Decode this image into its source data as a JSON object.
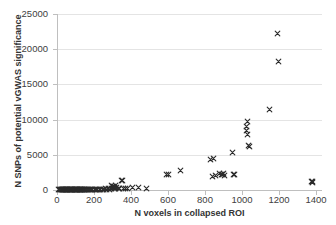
{
  "chart_data": {
    "type": "scatter",
    "title": "",
    "xlabel": "N voxels in collapsed ROI",
    "ylabel": "N SNPs of potential vGWAS significance",
    "xlim": [
      0,
      1400
    ],
    "ylim": [
      0,
      25000
    ],
    "grid": "horizontal",
    "legend": "none",
    "marker": "x",
    "marker_color": "#2b2b2b",
    "gridline_color": "#e4e4e4",
    "axis_color": "#bfbfbf",
    "xticks": [
      0,
      200,
      400,
      600,
      800,
      1000,
      1200,
      1400
    ],
    "xtick_labels": [
      "0",
      "200",
      "400",
      "600",
      "800",
      "1000",
      "1200",
      "1400"
    ],
    "yticks": [
      0,
      5000,
      10000,
      15000,
      20000,
      25000
    ],
    "ytick_labels": [
      "0",
      "5000",
      "10000",
      "15000",
      "20000",
      "25000"
    ],
    "series": [
      {
        "name": "ROIs",
        "points": [
          [
            10,
            40
          ],
          [
            15,
            35
          ],
          [
            18,
            50
          ],
          [
            22,
            30
          ],
          [
            25,
            60
          ],
          [
            28,
            45
          ],
          [
            30,
            55
          ],
          [
            33,
            40
          ],
          [
            36,
            70
          ],
          [
            38,
            35
          ],
          [
            41,
            50
          ],
          [
            44,
            60
          ],
          [
            47,
            45
          ],
          [
            50,
            80
          ],
          [
            53,
            40
          ],
          [
            56,
            65
          ],
          [
            59,
            55
          ],
          [
            62,
            70
          ],
          [
            65,
            45
          ],
          [
            68,
            60
          ],
          [
            71,
            50
          ],
          [
            74,
            75
          ],
          [
            77,
            55
          ],
          [
            80,
            65
          ],
          [
            83,
            45
          ],
          [
            86,
            70
          ],
          [
            89,
            60
          ],
          [
            92,
            80
          ],
          [
            95,
            50
          ],
          [
            98,
            65
          ],
          [
            101,
            75
          ],
          [
            104,
            55
          ],
          [
            107,
            85
          ],
          [
            110,
            60
          ],
          [
            113,
            70
          ],
          [
            116,
            90
          ],
          [
            119,
            65
          ],
          [
            122,
            75
          ],
          [
            125,
            55
          ],
          [
            128,
            95
          ],
          [
            131,
            70
          ],
          [
            134,
            80
          ],
          [
            137,
            60
          ],
          [
            140,
            100
          ],
          [
            143,
            75
          ],
          [
            147,
            85
          ],
          [
            151,
            65
          ],
          [
            155,
            110
          ],
          [
            160,
            80
          ],
          [
            165,
            95
          ],
          [
            170,
            70
          ],
          [
            176,
            120
          ],
          [
            182,
            90
          ],
          [
            188,
            105
          ],
          [
            194,
            75
          ],
          [
            200,
            130
          ],
          [
            207,
            95
          ],
          [
            214,
            115
          ],
          [
            221,
            85
          ],
          [
            228,
            140
          ],
          [
            236,
            110
          ],
          [
            244,
            125
          ],
          [
            252,
            95
          ],
          [
            260,
            160
          ],
          [
            268,
            120
          ],
          [
            276,
            180
          ],
          [
            284,
            140
          ],
          [
            292,
            200
          ],
          [
            296,
            700
          ],
          [
            300,
            430
          ],
          [
            303,
            380
          ],
          [
            306,
            520
          ],
          [
            309,
            300
          ],
          [
            312,
            250
          ],
          [
            315,
            620
          ],
          [
            318,
            180
          ],
          [
            322,
            340
          ],
          [
            330,
            160
          ],
          [
            340,
            240
          ],
          [
            350,
            1350
          ],
          [
            355,
            1300
          ],
          [
            362,
            200
          ],
          [
            372,
            210
          ],
          [
            382,
            180
          ],
          [
            408,
            330
          ],
          [
            438,
            320
          ],
          [
            485,
            230
          ],
          [
            590,
            2200
          ],
          [
            600,
            2150
          ],
          [
            668,
            2750
          ],
          [
            832,
            4280
          ],
          [
            840,
            1950
          ],
          [
            848,
            4500
          ],
          [
            855,
            2050
          ],
          [
            880,
            2280
          ],
          [
            888,
            2200
          ],
          [
            895,
            2150
          ],
          [
            900,
            2300
          ],
          [
            905,
            2100
          ],
          [
            948,
            5350
          ],
          [
            955,
            2200
          ],
          [
            962,
            2150
          ],
          [
            1022,
            9050
          ],
          [
            1026,
            8500
          ],
          [
            1030,
            9700
          ],
          [
            1032,
            7900
          ],
          [
            1036,
            6300
          ],
          [
            1040,
            6200
          ],
          [
            1150,
            11400
          ],
          [
            1192,
            22200
          ],
          [
            1198,
            18300
          ],
          [
            1375,
            1250
          ],
          [
            1380,
            1150
          ],
          [
            1383,
            1100
          ]
        ]
      }
    ]
  }
}
